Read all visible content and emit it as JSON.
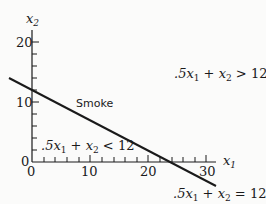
{
  "diagram": {
    "type": "linear-inequality-graph",
    "axes": {
      "x": {
        "label": "x",
        "label_sub": "1",
        "ticks": [
          "0",
          "10",
          "20",
          "30"
        ]
      },
      "y": {
        "label": "x",
        "label_sub": "2",
        "ticks": [
          "0",
          "10",
          "20"
        ]
      }
    },
    "line": {
      "name": "Smoke",
      "equation": {
        "a": ".5x",
        "a_sub": "1",
        "op1": " + x",
        "b_sub": "2",
        "rel": " = 12"
      }
    },
    "regions": {
      "above": {
        "a": ".5x",
        "a_sub": "1",
        "op1": " + x",
        "b_sub": "2",
        "rel": " > 12"
      },
      "below": {
        "a": ".5x",
        "a_sub": "1",
        "op1": " + x",
        "b_sub": "2",
        "rel": " < 12"
      }
    },
    "colors": {
      "ink": "#1a1a1a",
      "background": "#fbfbfa"
    }
  }
}
